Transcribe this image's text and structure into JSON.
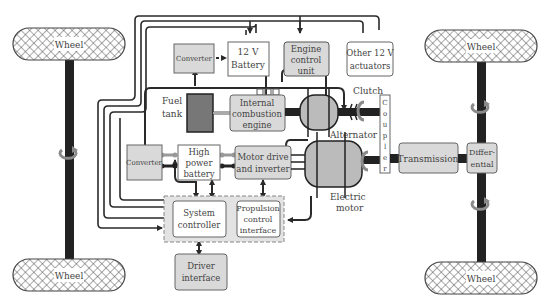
{
  "diagram": {
    "colors": {
      "gray_box": "#d9d9d9",
      "white_box": "#ffffff",
      "dark_box": "#777777",
      "line": "#2a2a2a",
      "axle": "#222222",
      "rotation_arrow": "#8a8a8a"
    },
    "wheels": {
      "front_left": "Wheel",
      "rear_left": "Wheel",
      "front_right": "Wheel",
      "rear_right": "Wheel"
    },
    "blocks": {
      "converter_top": "Converter",
      "battery_12v": [
        "12 V",
        "Battery"
      ],
      "engine_control_unit": [
        "Engine",
        "control",
        "unit"
      ],
      "other_actuators": [
        "Other 12 V",
        "actuators"
      ],
      "fuel_tank": [
        "Fuel",
        "tank"
      ],
      "ice": [
        "Internal",
        "combustion",
        "engine"
      ],
      "converter_mid": "Converter",
      "high_power_battery": [
        "High",
        "power",
        "battery"
      ],
      "motor_drive": [
        "Motor drive",
        "and inverter"
      ],
      "system_controller": [
        "System",
        "controller"
      ],
      "propulsion_control": [
        "Propulsion",
        "control",
        "interface"
      ],
      "driver_interface": [
        "Driver",
        "interface"
      ],
      "transmission": "Transmission",
      "differential": [
        "Differ-",
        "ential"
      ],
      "coupler": [
        "C",
        "o",
        "u",
        "p",
        "l",
        "e",
        "r"
      ]
    },
    "labels": {
      "clutch": "Clutch",
      "alternator": "Alternator",
      "electric_motor": [
        "Electric",
        "motor"
      ]
    }
  }
}
